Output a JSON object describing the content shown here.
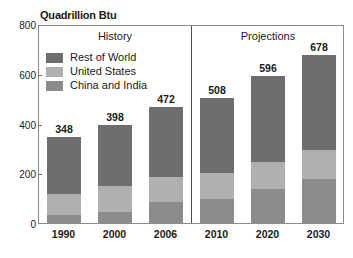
{
  "chart_data": {
    "type": "bar",
    "title": "Quadrillion Btu",
    "subtitle": "",
    "xlabel": "",
    "ylabel": "",
    "stacked": true,
    "grid": false,
    "legend_position": "inside-top-left",
    "ylim": [
      0,
      800
    ],
    "yticks": [
      0,
      200,
      400,
      600,
      800
    ],
    "ytick_labels": [
      "0",
      "200",
      "400",
      "600",
      "800"
    ],
    "categories": [
      "1990",
      "2000",
      "2006",
      "2010",
      "2020",
      "2030"
    ],
    "series": [
      {
        "name": "China and India",
        "color": "#8c8c8c",
        "values": [
          38,
          48,
          88,
          101,
          142,
          182
        ]
      },
      {
        "name": "United States",
        "color": "#b0b0b0",
        "values": [
          82,
          103,
          101,
          103,
          107,
          116
        ]
      },
      {
        "name": "Rest of World",
        "color": "#6e6e6e",
        "values": [
          228,
          247,
          283,
          304,
          347,
          380
        ]
      }
    ],
    "totals": [
      348,
      398,
      472,
      508,
      596,
      678
    ],
    "total_labels": [
      "348",
      "398",
      "472",
      "508",
      "596",
      "678"
    ],
    "panels": [
      {
        "label": "History",
        "categories": [
          "1990",
          "2000",
          "2006"
        ]
      },
      {
        "label": "Projections",
        "categories": [
          "2010",
          "2020",
          "2030"
        ]
      }
    ],
    "annotations": [
      "History",
      "Projections"
    ]
  },
  "legend": {
    "items": [
      {
        "label": "Rest of World",
        "color": "#6e6e6e"
      },
      {
        "label": "United States",
        "color": "#b0b0b0"
      },
      {
        "label": "China and India",
        "color": "#8c8c8c"
      }
    ]
  },
  "colors": {
    "rest_of_world": "#6e6e6e",
    "united_states": "#b0b0b0",
    "china_and_india": "#8c8c8c",
    "frame": "#8a8a8a",
    "divider": "#4d4d4d",
    "text": "#1a1a1a",
    "background": "#ffffff"
  },
  "bottom_artifact": {
    "text": ""
  }
}
